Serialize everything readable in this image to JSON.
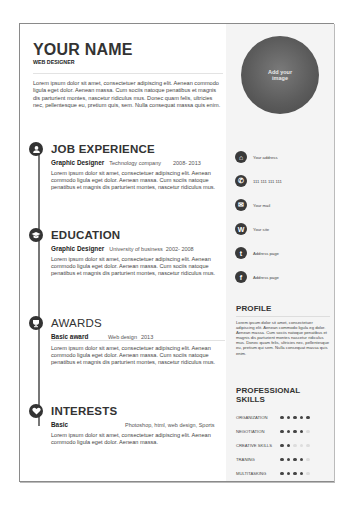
{
  "header": {
    "name": "YOUR NAME",
    "role": "WEB DESIGNER",
    "intro": "Lorem ipsum dolor sit amet, consectetuer adipiscing elit. Aenean commodo ligula eget dolor. Aenean massa. Cum sociis natoque penatibus et magnis dis parturient montes, nascetur ridiculus mus. Donec quam felis, ultricies nec, pellentesque eu, pretium quis, sem. Nulla consequat massa quis enim."
  },
  "photo": {
    "placeholder": "Add your image"
  },
  "sections": [
    {
      "icon": "user-icon",
      "title": "JOB EXPERIENCE",
      "entry": {
        "title": "Graphic Designer",
        "org": "Technology company",
        "years": "2008- 2013"
      },
      "description": "Lorem ipsum dolor sit amet, consectetuer adipiscing elit. Aenean commodo ligula eget dolor. Aenean massa. Cum sociis natoque penatibus et magnis dis parturient montes, nascetur ridiculus mus."
    },
    {
      "icon": "graduation-cap-icon",
      "title": "EDUCATION",
      "entry": {
        "title": "Graphic Designer",
        "org": "University of business",
        "years": "2002- 2008"
      },
      "description": "Lorem ipsum dolor sit amet, consectetuer adipiscing elit. Aenean commodo ligula eget dolor. Aenean massa. Cum sociis natoque penatibus et magnis dis parturient montes, nascetur ridiculus mus."
    },
    {
      "icon": "trophy-icon",
      "title": "AWARDS",
      "entry": {
        "title": "Basic award",
        "org": "Web design",
        "years": "2013"
      },
      "description": "Lorem ipsum dolor sit amet, consectetuer adipiscing elit. Aenean commodo ligula eget dolor. Aenean massa. Cum sociis natoque penatibus et magnis dis parturient montes, nascetur ridiculus mus."
    },
    {
      "icon": "heart-icon",
      "title": "INTERESTS",
      "entry": {
        "title": "Basic",
        "org": "Photoshop, html, web design, Sports",
        "years": ""
      },
      "description": "Lorem ipsum dolor sit amet, consectetuer adipiscing elit. Aenean commodo ligula eget dolor. Aenean massa."
    }
  ],
  "contact": [
    {
      "icon": "home-icon",
      "glyph": "⌂",
      "label": "Your address"
    },
    {
      "icon": "phone-icon",
      "glyph": "✆",
      "label": "111 111 111 111"
    },
    {
      "icon": "mail-icon",
      "glyph": "✉",
      "label": "Your mail"
    },
    {
      "icon": "website-icon",
      "glyph": "W",
      "label": "Your site"
    },
    {
      "icon": "twitter-icon",
      "glyph": "t",
      "label": "Address page"
    },
    {
      "icon": "facebook-icon",
      "glyph": "f",
      "label": "Address page"
    }
  ],
  "profile": {
    "title": "PROFILE",
    "text": "Lorem ipsum dolor sit amet, consectetuer adipiscing elit. Aenean commodo ligula eg dolor. Aenean massa. Cum sociis natoque penatibus et magnis dis parturient montes nascetur ridiculus mus. Donec quam felis, ultricies nec, pellentesque eu, pretium qui sem. Nulla consequat massa quis enim."
  },
  "skills": {
    "title": "PROFESSIONAL SKILLS",
    "items": [
      {
        "name": "ORGANIZATION",
        "level": 5,
        "max": 5
      },
      {
        "name": "NEGOTIATION",
        "level": 4,
        "max": 5
      },
      {
        "name": "CREATIVE SKILLS",
        "level": 2,
        "max": 5
      },
      {
        "name": "TRANING",
        "level": 4,
        "max": 5
      },
      {
        "name": "MULTITASKING",
        "level": 4,
        "max": 5
      }
    ]
  }
}
